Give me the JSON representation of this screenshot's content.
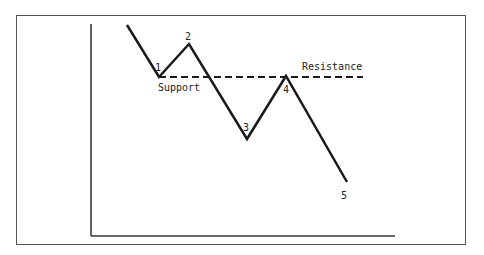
{
  "diagram": {
    "type": "support-resistance",
    "colors": {
      "line": "#1a1a1a",
      "frame": "#555555",
      "background": "#ffffff"
    },
    "labels": {
      "support": "Support",
      "resistance": "Resistance",
      "points": [
        "1",
        "2",
        "3",
        "4",
        "5"
      ]
    },
    "price_path": [
      {
        "id": "start",
        "x": 127,
        "y": 25
      },
      {
        "id": "1",
        "x": 159,
        "y": 77
      },
      {
        "id": "2",
        "x": 189,
        "y": 44
      },
      {
        "id": "3",
        "x": 247,
        "y": 139
      },
      {
        "id": "4",
        "x": 286,
        "y": 76
      },
      {
        "id": "5",
        "x": 347,
        "y": 182
      }
    ],
    "level_line": {
      "style": "dashed",
      "x1": 159,
      "x2": 363,
      "y": 77
    }
  }
}
